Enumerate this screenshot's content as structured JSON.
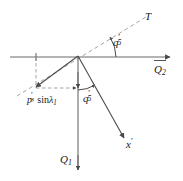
{
  "figure": {
    "background_color": "#ffffff",
    "line_color": "#555555",
    "dash_color": "#9a9a9a",
    "text_color": "#1a1a1a",
    "width": 183,
    "height": 181
  },
  "labels": {
    "tangent_axis": "T",
    "angle_upper": {
      "base": "q",
      "prime": "′",
      "sub": "5"
    },
    "angle_lower": {
      "base": "q",
      "prime": "′",
      "sub": "5"
    },
    "axis_q2": {
      "base": "Q",
      "sub": "2"
    },
    "axis_q1": {
      "base": "Q",
      "sub": "1"
    },
    "axis_xprime": {
      "base": "x",
      "prime": "′"
    },
    "projection": {
      "p": "p",
      "p_prime": "′",
      "p_sub": "3",
      "sin": "sin",
      "lambda": "λ",
      "lambda_sub": "1",
      "full_text": "p′3 sin λ1"
    }
  },
  "geometry": {
    "origin": {
      "x": 78,
      "y": 56
    },
    "horizontal_axis": {
      "x1": 10,
      "y1": 57,
      "x2": 172,
      "y2": 57
    },
    "tangent_line": {
      "x1": 17,
      "y1": 96,
      "x2": 146,
      "y2": 17
    },
    "vertical_axis": {
      "x1": 78,
      "y1": 56,
      "x2": 78,
      "y2": 172
    },
    "x_prime_ray": {
      "x1": 78,
      "y1": 56,
      "x2": 124,
      "y2": 138
    },
    "projection_vector": {
      "x1": 78,
      "y1": 56,
      "x2": 35,
      "y2": 87
    },
    "dashed_vertical": {
      "x1": 36,
      "y1": 57,
      "x2": 36,
      "y2": 88
    },
    "dashed_horizontal": {
      "x1": 36,
      "y1": 88,
      "x2": 78,
      "y2": 88
    },
    "angle_upper_arc_degrees": 31,
    "angle_lower_arc_degrees": 29
  }
}
